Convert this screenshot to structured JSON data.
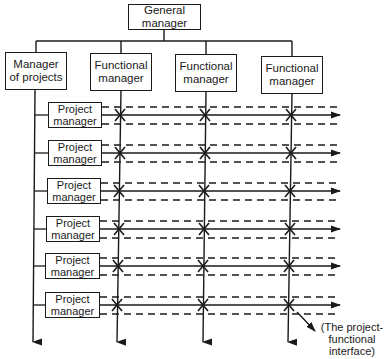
{
  "diagram": {
    "type": "matrix-organization-chart",
    "top": {
      "general_manager": "General\nmanager"
    },
    "second_level": [
      {
        "label": "Manager\nof projects",
        "role": "manager-of-projects"
      },
      {
        "label": "Functional\nmanager",
        "role": "functional-manager"
      },
      {
        "label": "Functional\nmanager",
        "role": "functional-manager"
      },
      {
        "label": "Functional\nmanager",
        "role": "functional-manager"
      }
    ],
    "project_managers": [
      {
        "label": "Project\nmanager"
      },
      {
        "label": "Project\nmanager"
      },
      {
        "label": "Project\nmanager"
      },
      {
        "label": "Project\nmanager"
      },
      {
        "label": "Project\nmanager"
      },
      {
        "label": "Project\nmanager"
      }
    ],
    "annotation": "(The project-\nfunctional\ninterface)",
    "colors": {
      "line": "#1a1a1a",
      "background": "#ffffff"
    }
  }
}
